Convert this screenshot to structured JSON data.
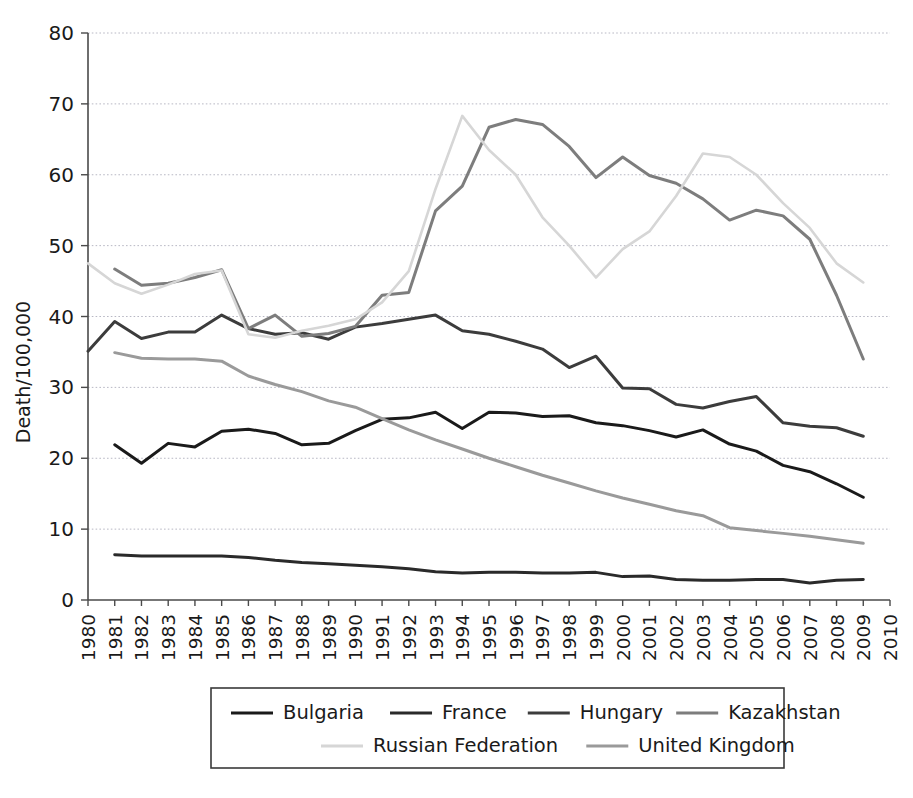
{
  "chart_data": {
    "type": "line",
    "title": "",
    "subtitle": "",
    "xlabel": "",
    "ylabel": "Death/100,000",
    "xlim": [
      1980,
      2010
    ],
    "ylim": [
      0,
      80
    ],
    "yticks": [
      0,
      10,
      20,
      30,
      40,
      50,
      60,
      70,
      80
    ],
    "xticks": [
      1980,
      1981,
      1982,
      1983,
      1984,
      1985,
      1986,
      1987,
      1988,
      1989,
      1990,
      1991,
      1992,
      1993,
      1994,
      1995,
      1996,
      1997,
      1998,
      1999,
      2000,
      2001,
      2002,
      2003,
      2004,
      2005,
      2006,
      2007,
      2008,
      2009,
      2010
    ],
    "grid": "horizontal",
    "legend_position": "bottom",
    "x": [
      1980,
      1981,
      1982,
      1983,
      1984,
      1985,
      1986,
      1987,
      1988,
      1989,
      1990,
      1991,
      1992,
      1993,
      1994,
      1995,
      1996,
      1997,
      1998,
      1999,
      2000,
      2001,
      2002,
      2003,
      2004,
      2005,
      2006,
      2007,
      2008,
      2009,
      2010
    ],
    "series": [
      {
        "name": "Bulgaria",
        "color": "#1a1a1a",
        "x": [
          1981,
          1982,
          1983,
          1984,
          1985,
          1986,
          1987,
          1988,
          1989,
          1990,
          1991,
          1992,
          1993,
          1994,
          1995,
          1996,
          1997,
          1998,
          1999,
          2000,
          2001,
          2002,
          2003,
          2004,
          2005,
          2006,
          2007,
          2008,
          2009
        ],
        "values": [
          21.9,
          19.3,
          22.1,
          21.6,
          23.8,
          24.1,
          23.5,
          21.9,
          22.1,
          23.9,
          25.5,
          25.7,
          26.5,
          24.2,
          26.5,
          26.4,
          25.9,
          26.0,
          25.0,
          24.6,
          23.9,
          23.0,
          24.0,
          22.0,
          21.0,
          19.0,
          18.1,
          16.4,
          14.5
        ]
      },
      {
        "name": "France",
        "color": "#2a2a2a",
        "x": [
          1981,
          1982,
          1983,
          1984,
          1985,
          1986,
          1987,
          1988,
          1989,
          1990,
          1991,
          1992,
          1993,
          1994,
          1995,
          1996,
          1997,
          1998,
          1999,
          2000,
          2001,
          2002,
          2003,
          2004,
          2005,
          2006,
          2007,
          2008,
          2009
        ],
        "values": [
          6.4,
          6.2,
          6.2,
          6.2,
          6.2,
          6.0,
          5.6,
          5.3,
          5.1,
          4.9,
          4.7,
          4.4,
          4.0,
          3.8,
          3.9,
          3.9,
          3.8,
          3.8,
          3.9,
          3.3,
          3.4,
          2.9,
          2.8,
          2.8,
          2.9,
          2.9,
          2.4,
          2.8,
          2.9
        ]
      },
      {
        "name": "Hungary",
        "color": "#3c3c3c",
        "x": [
          1980,
          1981,
          1982,
          1983,
          1984,
          1985,
          1986,
          1987,
          1988,
          1989,
          1990,
          1991,
          1992,
          1993,
          1994,
          1995,
          1996,
          1997,
          1998,
          1999,
          2000,
          2001,
          2002,
          2003,
          2004,
          2005,
          2006,
          2007,
          2008,
          2009
        ],
        "values": [
          35.1,
          39.3,
          36.9,
          37.8,
          37.8,
          40.2,
          38.3,
          37.5,
          37.7,
          36.8,
          38.5,
          39.0,
          39.6,
          40.2,
          38.0,
          37.5,
          36.5,
          35.4,
          32.8,
          34.4,
          29.9,
          29.8,
          27.6,
          27.1,
          28.0,
          28.7,
          25.0,
          24.5,
          24.3,
          23.1
        ]
      },
      {
        "name": "Kazakhstan",
        "color": "#7d7d7d",
        "x": [
          1981,
          1982,
          1983,
          1984,
          1985,
          1986,
          1987,
          1988,
          1989,
          1990,
          1991,
          1992,
          1993,
          1994,
          1995,
          1996,
          1997,
          1998,
          1999,
          2000,
          2001,
          2002,
          2003,
          2004,
          2005,
          2006,
          2007,
          2008,
          2009
        ],
        "values": [
          46.7,
          44.4,
          44.7,
          45.5,
          46.6,
          38.3,
          40.2,
          37.2,
          37.6,
          38.6,
          43.0,
          43.4,
          54.9,
          58.4,
          66.7,
          67.8,
          67.1,
          64.0,
          59.6,
          62.5,
          59.9,
          58.8,
          56.6,
          53.6,
          55.0,
          54.2,
          50.9,
          43.0,
          34.0
        ]
      },
      {
        "name": "Russian Federation",
        "color": "#d6d6d6",
        "x": [
          1980,
          1981,
          1982,
          1983,
          1984,
          1985,
          1986,
          1987,
          1988,
          1989,
          1990,
          1991,
          1992,
          1993,
          1994,
          1995,
          1996,
          1997,
          1998,
          1999,
          2000,
          2001,
          2002,
          2003,
          2004,
          2005,
          2006,
          2007,
          2008,
          2009
        ],
        "values": [
          47.5,
          44.7,
          43.2,
          44.5,
          46.0,
          46.5,
          37.5,
          37.0,
          38.0,
          38.7,
          39.6,
          42.0,
          46.4,
          58.0,
          68.3,
          63.5,
          60.0,
          54.0,
          50.0,
          45.5,
          49.5,
          52.0,
          57.0,
          63.0,
          62.5,
          60.0,
          56.0,
          52.5,
          47.5,
          44.8
        ]
      },
      {
        "name": "United Kingdom",
        "color": "#9a9a9a",
        "x": [
          1981,
          1982,
          1983,
          1984,
          1985,
          1986,
          1987,
          1988,
          1989,
          1990,
          1991,
          1992,
          1993,
          1994,
          1995,
          1996,
          1997,
          1998,
          1999,
          2000,
          2001,
          2002,
          2003,
          2004,
          2005,
          2006,
          2007,
          2008,
          2009
        ],
        "values": [
          34.9,
          34.1,
          34.0,
          34.0,
          33.7,
          31.6,
          30.4,
          29.4,
          28.1,
          27.2,
          25.6,
          24.0,
          22.6,
          21.3,
          20.0,
          18.8,
          17.6,
          16.5,
          15.4,
          14.4,
          13.5,
          12.6,
          11.9,
          10.2,
          9.8,
          9.4,
          9.0,
          8.5,
          8.0
        ]
      }
    ],
    "legend": [
      {
        "label": "Bulgaria",
        "color": "#1a1a1a"
      },
      {
        "label": "France",
        "color": "#2a2a2a"
      },
      {
        "label": "Hungary",
        "color": "#3c3c3c"
      },
      {
        "label": "Kazakhstan",
        "color": "#7d7d7d"
      },
      {
        "label": "Russian Federation",
        "color": "#d6d6d6"
      },
      {
        "label": "United Kingdom",
        "color": "#9a9a9a"
      }
    ]
  },
  "axis": {
    "ylabel": "Death/100,000",
    "ytick_labels": [
      "0",
      "10",
      "20",
      "30",
      "40",
      "50",
      "60",
      "70",
      "80"
    ],
    "xtick_labels": [
      "1980",
      "1981",
      "1982",
      "1983",
      "1984",
      "1985",
      "1986",
      "1987",
      "1988",
      "1989",
      "1990",
      "1991",
      "1992",
      "1993",
      "1994",
      "1995",
      "1996",
      "1997",
      "1998",
      "1999",
      "2000",
      "2001",
      "2002",
      "2003",
      "2004",
      "2005",
      "2006",
      "2007",
      "2008",
      "2009",
      "2010"
    ]
  },
  "style": {
    "axis_color": "#4a4a4a",
    "grid_color": "#b8b8c4",
    "background": "#ffffff",
    "legend_border": "#3a3a3a"
  }
}
